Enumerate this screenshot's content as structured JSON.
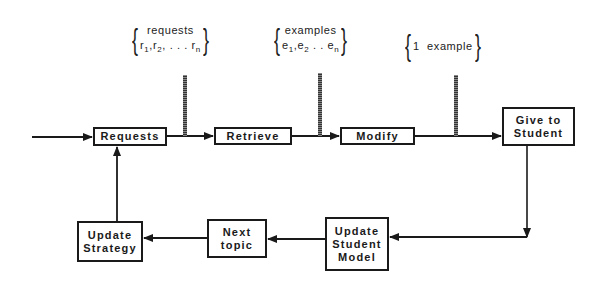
{
  "diagram": {
    "nodes": [
      {
        "id": "requests",
        "label": "Requests"
      },
      {
        "id": "retrieve",
        "label": "Retrieve"
      },
      {
        "id": "modify",
        "label": "Modify"
      },
      {
        "id": "give_to_student",
        "label": "Give to\nStudent"
      },
      {
        "id": "update_student_model",
        "label": "Update\nStudent\nModel"
      },
      {
        "id": "next_topic",
        "label": "Next\ntopic"
      },
      {
        "id": "update_strategy",
        "label": "Update\nStrategy"
      }
    ],
    "annotations": [
      {
        "id": "requests_set",
        "title": "requests",
        "items": [
          "r",
          "1",
          "r",
          "2",
          ". . . r",
          "n"
        ],
        "attached_to": "requests->retrieve"
      },
      {
        "id": "examples_set",
        "title": "examples",
        "items": [
          "e",
          "1",
          "e",
          "2",
          ". . e",
          "n"
        ],
        "attached_to": "retrieve->modify"
      },
      {
        "id": "one_example_set",
        "title": "1  example",
        "attached_to": "modify->give_to_student"
      }
    ],
    "edges": [
      {
        "from": "entry",
        "to": "requests"
      },
      {
        "from": "requests",
        "to": "retrieve"
      },
      {
        "from": "retrieve",
        "to": "modify"
      },
      {
        "from": "modify",
        "to": "give_to_student"
      },
      {
        "from": "give_to_student",
        "to": "update_student_model"
      },
      {
        "from": "update_student_model",
        "to": "next_topic"
      },
      {
        "from": "next_topic",
        "to": "update_strategy"
      },
      {
        "from": "update_strategy",
        "to": "requests"
      }
    ]
  },
  "colors": {
    "ink": "#1a1a1a",
    "background": "#ffffff"
  }
}
